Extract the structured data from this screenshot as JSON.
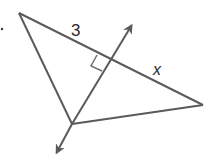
{
  "diagram": {
    "labels": {
      "segment_top": "3",
      "segment_right": "x"
    },
    "marks": {
      "right_angle": true
    },
    "colors": {
      "stroke": "#5a5a5a",
      "text": "#2a2a2a",
      "background": "#ffffff"
    }
  }
}
